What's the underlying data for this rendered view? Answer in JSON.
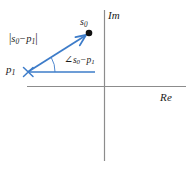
{
  "figure": {
    "background_color": "#ffffff",
    "vector_color": "#3d7cc9",
    "axis_color": "#8c8c8c",
    "text_color": "#1a1a1a",
    "axes": {
      "imaginary_label": "Im",
      "real_label": "Re",
      "origin_px": [
        104,
        86
      ]
    },
    "points": {
      "s0": {
        "label_base": "s",
        "label_sub": "0",
        "marker": "filled-dot",
        "position_px": [
          88,
          33
        ]
      },
      "p1": {
        "label_base": "p",
        "label_sub": "1",
        "marker": "cross",
        "position_px": [
          28,
          72
        ]
      }
    },
    "annotations": {
      "magnitude": {
        "open_bar": "|",
        "base_1": "s",
        "sub_1": "0",
        "operator": "−",
        "base_2": "p",
        "sub_2": "1",
        "close_bar": "|",
        "plain_text": "|s0 - p1|"
      },
      "angle": {
        "angle_symbol": "∠",
        "base_1": "s",
        "sub_1": "0",
        "operator": "−",
        "base_2": "p",
        "sub_2": "1",
        "plain_text": "angle(s0 - p1)"
      }
    },
    "vector": {
      "from_px": [
        28,
        72
      ],
      "to_px": [
        86,
        35
      ],
      "arrowhead": "open-arrow"
    },
    "reference_line": {
      "from_px": [
        28,
        72
      ],
      "to_px": [
        95,
        72
      ],
      "description": "horizontal reference ray from p1"
    },
    "angle_arc": {
      "center_px": [
        28,
        72
      ],
      "radius_px": 27,
      "start_deg": 0,
      "end_deg": 32
    }
  }
}
